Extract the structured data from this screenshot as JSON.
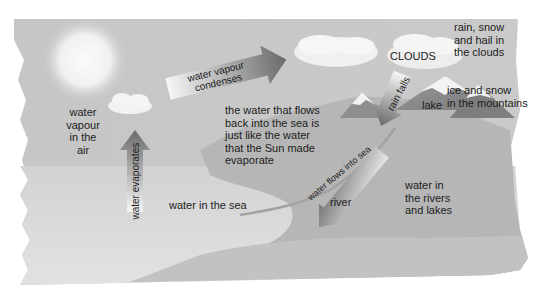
{
  "diagram": {
    "elements": {
      "sun": {
        "icon": "sun-icon"
      },
      "cloud_small": {
        "icon": "cloud-icon"
      },
      "clouds_label": "CLOUDS"
    },
    "labels": {
      "water_vapour_air": [
        "water",
        "vapour",
        "in the",
        "air"
      ],
      "clouds": "CLOUDS",
      "rain_snow_hail": [
        "rain, snow",
        "and hail in",
        "the clouds"
      ],
      "ice_snow": [
        "ice and snow",
        "in the mountains"
      ],
      "lake": "lake",
      "water_flows_back": [
        "the water that flows",
        "back into the sea is",
        "just like the water",
        "that the Sun made",
        "evaporate"
      ],
      "water_in_sea": "water in the sea",
      "river": "river",
      "water_rivers_lakes": [
        "water in",
        "the rivers",
        "and lakes"
      ]
    },
    "arrows": {
      "condenses": [
        "water vapour",
        "condenses"
      ],
      "evaporates": "water evaporates",
      "rain_falls": "rain falls",
      "flows_into_sea": "water flows into sea"
    },
    "colors": {
      "sky": "#c8c8c8",
      "sea": "#d4d4d4",
      "land": "#b4b4b4",
      "mountain": "#8e8e8e",
      "snow": "#f2f2f2",
      "arrow_dark": "#6e6e6e",
      "arrow_light": "#f4f4f4",
      "text": "#1c1c1c"
    }
  }
}
